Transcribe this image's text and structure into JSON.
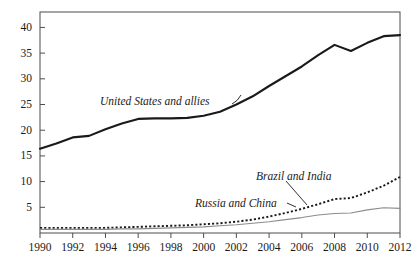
{
  "chart_data": {
    "type": "line",
    "title": "",
    "xlabel": "",
    "ylabel": "",
    "xlim": [
      1990,
      2012
    ],
    "ylim": [
      0,
      43
    ],
    "grid": false,
    "legend_position": "inline-annotations",
    "x": [
      1990,
      1991,
      1992,
      1993,
      1994,
      1995,
      1996,
      1997,
      1998,
      1999,
      2000,
      2001,
      2002,
      2003,
      2004,
      2005,
      2006,
      2007,
      2008,
      2009,
      2010,
      2011,
      2012
    ],
    "xticks": [
      1990,
      1992,
      1994,
      1996,
      1998,
      2000,
      2002,
      2004,
      2006,
      2008,
      2010,
      2012
    ],
    "xtick_labels": [
      "1990",
      "1992",
      "1994",
      "1996",
      "1998",
      "2000",
      "2002",
      "2004",
      "2006",
      "2008",
      "2010",
      "2012"
    ],
    "yticks": [
      5,
      10,
      15,
      20,
      25,
      30,
      35,
      40
    ],
    "ytick_labels": [
      "5",
      "10",
      "15",
      "20",
      "25",
      "30",
      "35",
      "40"
    ],
    "series": [
      {
        "name": "United States and allies",
        "style": "solid-thick",
        "color": "#1a1a1a",
        "label_text": "United States and allies",
        "values": [
          16.4,
          17.4,
          18.6,
          18.9,
          20.2,
          21.3,
          22.2,
          22.3,
          22.3,
          22.4,
          22.8,
          23.6,
          25.0,
          26.6,
          28.6,
          30.5,
          32.4,
          34.6,
          36.6,
          35.4,
          37.0,
          38.3,
          38.5
        ]
      },
      {
        "name": "Brazil and India",
        "style": "dotted",
        "color": "#1a1a1a",
        "label_text": "Brazil and India",
        "values": [
          1.0,
          1.0,
          1.0,
          1.0,
          1.0,
          1.1,
          1.2,
          1.3,
          1.4,
          1.5,
          1.7,
          1.9,
          2.2,
          2.6,
          3.2,
          3.9,
          4.7,
          5.6,
          6.6,
          6.8,
          7.9,
          9.2,
          10.9
        ]
      },
      {
        "name": "Russia and China",
        "style": "solid-thin",
        "color": "#8c8c8c",
        "label_text": "Russia and China",
        "values": [
          0.7,
          0.7,
          0.7,
          0.7,
          0.7,
          0.8,
          0.8,
          0.9,
          1.0,
          1.1,
          1.2,
          1.4,
          1.6,
          1.9,
          2.2,
          2.6,
          3.0,
          3.5,
          3.8,
          3.9,
          4.5,
          4.9,
          4.8
        ]
      }
    ],
    "annotations": [
      {
        "name": "us-allies-annotation",
        "text": "United States and allies",
        "x_px": 100,
        "y_px": 95
      },
      {
        "name": "brazil-india-annotation",
        "text": "Brazil and India",
        "x_px": 256,
        "y_px": 170
      },
      {
        "name": "russia-china-annotation",
        "text": "Russia and China",
        "x_px": 195,
        "y_px": 197
      }
    ]
  },
  "axes": {
    "frame_color": "#4d4d4d",
    "plot_left_px": 40,
    "plot_right_px": 400,
    "plot_top_px": 12,
    "plot_bottom_px": 233
  }
}
